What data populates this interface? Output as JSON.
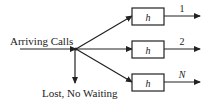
{
  "diagram": {
    "input_label": "Arriving Calls",
    "lost_label": "Lost, No Waiting",
    "servers": [
      {
        "box_label": "h",
        "output_label": "1"
      },
      {
        "box_label": "h",
        "output_label": "2"
      },
      {
        "box_label": "h",
        "output_label": "N"
      }
    ],
    "colors": {
      "line": "#222222",
      "background": "#ffffff"
    }
  }
}
